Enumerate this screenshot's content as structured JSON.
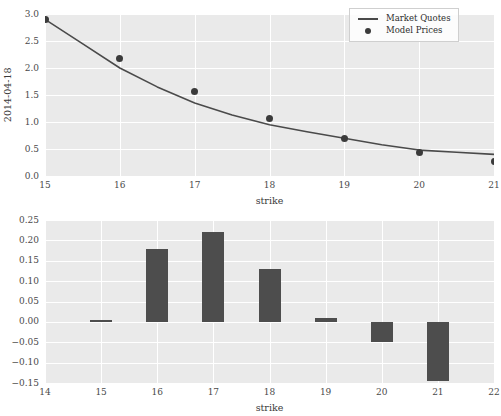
{
  "figure": {
    "background": "#ffffff",
    "panel_background": "#eaeaea",
    "grid_color": "#ffffff",
    "line_color": "#4a4a4a",
    "marker_color": "#3b3b3b",
    "bar_color": "#4d4d4d"
  },
  "legend": {
    "position": "upper right",
    "entries": [
      {
        "label": "Market Quotes",
        "key": "line"
      },
      {
        "label": "Model Prices",
        "key": "dot"
      }
    ]
  },
  "chart_data": [
    {
      "type": "line",
      "title": "",
      "xlabel": "strike",
      "ylabel": "2014-04-18",
      "xlim": [
        15,
        21
      ],
      "ylim": [
        0.0,
        3.0
      ],
      "xticks": [
        15,
        16,
        17,
        18,
        19,
        20,
        21
      ],
      "xticklabels": [
        "15",
        "16",
        "17",
        "18",
        "19",
        "20",
        "21"
      ],
      "yticks": [
        0.0,
        0.5,
        1.0,
        1.5,
        2.0,
        2.5,
        3.0
      ],
      "yticklabels": [
        "0.0",
        "0.5",
        "1.0",
        "1.5",
        "2.0",
        "2.5",
        "3.0"
      ],
      "grid": true,
      "legend_position": "upper right",
      "series": [
        {
          "name": "Market Quotes",
          "kind": "line",
          "x": [
            15.0,
            15.5,
            16.0,
            16.5,
            17.0,
            17.5,
            18.0,
            18.5,
            19.0,
            19.5,
            20.0,
            20.5,
            21.0
          ],
          "values": [
            2.9,
            2.45,
            2.0,
            1.65,
            1.35,
            1.13,
            0.95,
            0.82,
            0.7,
            0.58,
            0.48,
            0.44,
            0.4
          ]
        },
        {
          "name": "Model Prices",
          "kind": "scatter",
          "x": [
            15,
            16,
            17,
            18,
            19,
            20,
            21
          ],
          "values": [
            2.9,
            2.18,
            1.56,
            1.07,
            0.7,
            0.44,
            0.27
          ]
        }
      ]
    },
    {
      "type": "bar",
      "title": "",
      "xlabel": "strike",
      "ylabel": "",
      "xlim": [
        14,
        22
      ],
      "ylim": [
        -0.15,
        0.25
      ],
      "xticks": [
        14,
        15,
        16,
        17,
        18,
        19,
        20,
        21,
        22
      ],
      "xticklabels": [
        "14",
        "15",
        "16",
        "17",
        "18",
        "19",
        "20",
        "21",
        "22"
      ],
      "yticks": [
        -0.15,
        -0.1,
        -0.05,
        0.0,
        0.05,
        0.1,
        0.15,
        0.2,
        0.25
      ],
      "yticklabels": [
        "-0.15",
        "-0.10",
        "-0.05",
        "0.00",
        "0.05",
        "0.10",
        "0.15",
        "0.20",
        "0.25"
      ],
      "grid": true,
      "categories": [
        15,
        16,
        17,
        18,
        19,
        20,
        21
      ],
      "values": [
        0.005,
        0.18,
        0.22,
        0.13,
        0.01,
        -0.05,
        -0.145
      ]
    }
  ]
}
